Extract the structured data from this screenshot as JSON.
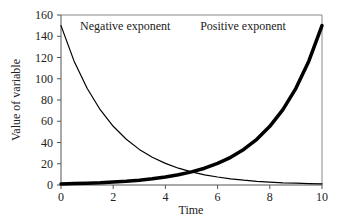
{
  "chart_data": {
    "type": "line",
    "title": "",
    "xlabel": "Time",
    "ylabel": "Value of variable",
    "xlim": [
      0,
      10
    ],
    "ylim": [
      0,
      160
    ],
    "xticks": [
      0,
      2,
      4,
      6,
      8,
      10
    ],
    "yticks": [
      0,
      20,
      40,
      60,
      80,
      100,
      120,
      140,
      160
    ],
    "grid": false,
    "legend": null,
    "annotations": [
      {
        "text": "Negative exponent",
        "x": 1.0,
        "y": 150
      },
      {
        "text": "Positive exponent",
        "x": 5.6,
        "y": 150
      }
    ],
    "x": [
      0,
      0.5,
      1,
      1.5,
      2,
      2.5,
      3,
      3.5,
      4,
      4.5,
      5,
      5.5,
      6,
      6.5,
      7,
      7.5,
      8,
      8.5,
      9,
      9.5,
      10
    ],
    "series": [
      {
        "name": "Negative exponent",
        "line_width": 1.2,
        "values": [
          150,
          116.8,
          91.0,
          70.9,
          55.2,
          43.0,
          33.5,
          26.1,
          20.3,
          15.8,
          12.3,
          9.6,
          7.5,
          5.8,
          4.5,
          3.5,
          2.7,
          2.1,
          1.7,
          1.3,
          1.0
        ]
      },
      {
        "name": "Positive exponent",
        "line_width": 3.5,
        "values": [
          1.0,
          1.3,
          1.7,
          2.1,
          2.7,
          3.5,
          4.5,
          5.8,
          7.5,
          9.6,
          12.3,
          15.8,
          20.3,
          26.1,
          33.5,
          43.0,
          55.2,
          70.9,
          91.0,
          116.8,
          150
        ]
      }
    ]
  }
}
